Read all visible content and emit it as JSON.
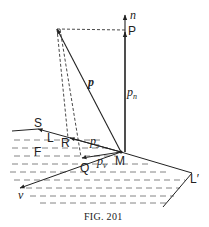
{
  "figure": {
    "caption": "Fig. 201",
    "caption_display": "FIG. 201"
  },
  "labels": {
    "n": "n",
    "P": "P",
    "p": "p",
    "p_n_base": "p",
    "p_n_sub": "n",
    "S": "S",
    "L": "L",
    "R": "R",
    "p_s_base": "p",
    "p_s_sub": "s",
    "F": "F",
    "Q": "Q",
    "p_v_base": "p",
    "p_v_sub": "v",
    "M": "M",
    "v": "v",
    "L_prime": "L′"
  },
  "colors": {
    "ink": "#222222",
    "hatch": "#555555",
    "background": "#ffffff"
  }
}
